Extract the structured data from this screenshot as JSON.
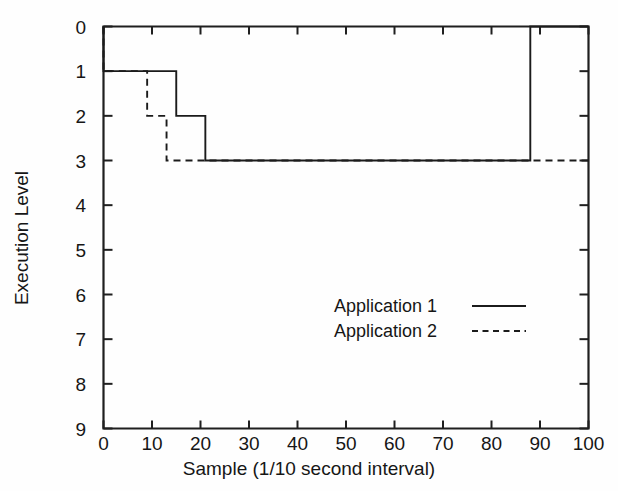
{
  "chart_data": {
    "type": "line",
    "subtype": "step",
    "title": "",
    "xlabel": "Sample (1/10 second interval)",
    "ylabel": "Execution Level",
    "xlim": [
      0,
      100
    ],
    "ylim": [
      0,
      9
    ],
    "y_axis_inverted": true,
    "grid": false,
    "legend_position": "center-right-inside",
    "xticks": [
      0,
      10,
      20,
      30,
      40,
      50,
      60,
      70,
      80,
      90,
      100
    ],
    "xtick_labels": [
      "0",
      "10",
      "20",
      "30",
      "40",
      "50",
      "60",
      "70",
      "80",
      "90",
      "100"
    ],
    "yticks": [
      0,
      1,
      2,
      3,
      4,
      5,
      6,
      7,
      8,
      9
    ],
    "ytick_labels": [
      "0",
      "1",
      "2",
      "3",
      "4",
      "5",
      "6",
      "7",
      "8",
      "9"
    ],
    "series": [
      {
        "name": "Application 1",
        "style": "solid",
        "color": "#1b1b1b",
        "x": [
          0,
          0,
          15,
          15,
          21,
          21,
          88,
          88,
          100
        ],
        "y": [
          0,
          1,
          1,
          2,
          2,
          3,
          3,
          0,
          0
        ]
      },
      {
        "name": "Application 2",
        "style": "dashed",
        "color": "#1b1b1b",
        "x": [
          0,
          0,
          9,
          9,
          12,
          12,
          13,
          13,
          100
        ],
        "y": [
          0,
          1,
          1,
          2,
          2,
          2,
          2,
          3,
          3
        ]
      }
    ],
    "legend": [
      {
        "label": "Application 1",
        "style": "solid"
      },
      {
        "label": "Application 2",
        "style": "dashed"
      }
    ]
  },
  "axes": {
    "xlabel": "Sample (1/10 second interval)",
    "ylabel": "Execution Level"
  },
  "legend": {
    "items": [
      {
        "label": "Application 1"
      },
      {
        "label": "Application 2"
      }
    ]
  },
  "colors": {
    "ink": "#1b1b1b",
    "paper": "#fefefe"
  }
}
